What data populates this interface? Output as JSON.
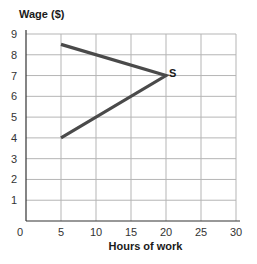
{
  "chart_data": {
    "type": "line",
    "title": "",
    "ylabel": "Wage ($)",
    "xlabel": "Hours of work",
    "xlim": [
      0,
      30
    ],
    "ylim": [
      0,
      9
    ],
    "xticks": [
      0,
      5,
      10,
      15,
      20,
      25,
      30
    ],
    "yticks": [
      1,
      2,
      3,
      4,
      5,
      6,
      7,
      8,
      9
    ],
    "grid": true,
    "legend": null,
    "series": [
      {
        "name": "S",
        "label": "S",
        "color": "#4a4a4a",
        "points": [
          {
            "x": 5,
            "y": 8.5
          },
          {
            "x": 20,
            "y": 7
          },
          {
            "x": 5,
            "y": 4
          }
        ]
      }
    ],
    "annotations": [
      {
        "text": "S",
        "x": 20,
        "y": 7
      }
    ]
  },
  "labels": {
    "y_axis_title": "Wage ($)",
    "x_axis_title": "Hours of work",
    "origin_label": "0"
  },
  "colors": {
    "grid": "#b5b5b5",
    "axis": "#333333",
    "curve": "#4a4a4a"
  }
}
